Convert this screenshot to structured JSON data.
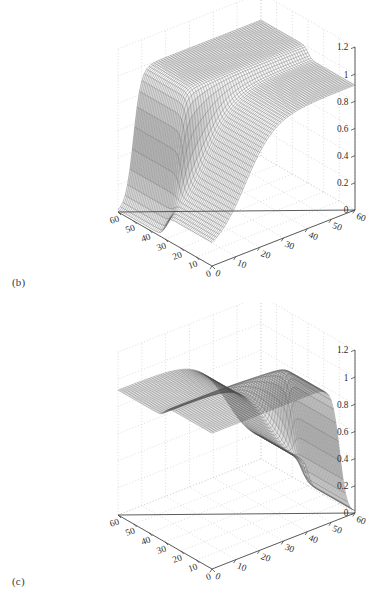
{
  "figure": {
    "background": "#ffffff",
    "ink": "#2b2b2b",
    "grid_color": "#c9c9c9",
    "axis_color": "#4a4a4a",
    "mesh_color": "#555555"
  },
  "panels": [
    {
      "id": "b",
      "label": "(b)",
      "zticks": [
        "1.2",
        "1",
        "0.8",
        "0.6",
        "0.4",
        "0.2",
        "0"
      ],
      "zvalues": [
        1.2,
        1,
        0.8,
        0.6,
        0.4,
        0.2,
        0
      ],
      "xticks_left": [
        "60",
        "50",
        "40",
        "30",
        "20",
        "10",
        "0"
      ],
      "xticks_right": [
        "0",
        "10",
        "20",
        "30",
        "40",
        "50",
        "60"
      ]
    },
    {
      "id": "c",
      "label": "(c)",
      "zticks": [
        "1.2",
        "1",
        "0.8",
        "0.6",
        "0.4",
        "0.2",
        "0"
      ],
      "zvalues": [
        1.2,
        1,
        0.8,
        0.6,
        0.4,
        0.2,
        0
      ],
      "xticks_left": [
        "60",
        "50",
        "40",
        "30",
        "20",
        "10",
        "0"
      ],
      "xticks_right": [
        "0",
        "10",
        "20",
        "30",
        "40",
        "50",
        "60"
      ]
    }
  ],
  "chart_data": [
    {
      "type": "surface",
      "panel": "b",
      "title": "",
      "xlabel": "",
      "ylabel": "",
      "zlabel": "",
      "xlim": [
        0,
        60
      ],
      "ylim": [
        0,
        60
      ],
      "zlim": [
        0,
        1.2
      ],
      "xticks": [
        0,
        10,
        20,
        30,
        40,
        50,
        60
      ],
      "yticks": [
        0,
        10,
        20,
        30,
        40,
        50,
        60
      ],
      "zticks": [
        0,
        0.2,
        0.4,
        0.6,
        0.8,
        1.0,
        1.2
      ],
      "grid": true,
      "legend": "none",
      "rendering": "wireframe-mesh",
      "description": "Step-like saturating surface: a low-valued plateau occupying roughly x<30 rising from about 0.1 to 0.9 along y, a sharp near-vertical cliff near x=30, and a high plateau near 1.0 for x>30 that falls steeply toward 0 at the front y edge.",
      "surface_samples": {
        "x": [
          0,
          10,
          20,
          30,
          40,
          50,
          60
        ],
        "y": [
          0,
          10,
          20,
          30,
          40,
          50,
          60
        ],
        "z": [
          [
            0.1,
            0.12,
            0.14,
            0.16,
            0.18,
            0.2,
            0.22
          ],
          [
            0.12,
            0.2,
            0.3,
            0.42,
            0.55,
            0.66,
            0.74
          ],
          [
            0.14,
            0.28,
            0.46,
            0.64,
            0.78,
            0.86,
            0.9
          ],
          [
            0.16,
            0.4,
            0.66,
            0.84,
            0.92,
            0.95,
            0.96
          ],
          [
            0.05,
            0.55,
            0.88,
            0.98,
            1.0,
            1.0,
            1.0
          ],
          [
            0.02,
            0.6,
            0.95,
            1.0,
            1.0,
            1.0,
            1.0
          ],
          [
            0.01,
            0.62,
            0.97,
            1.0,
            1.0,
            1.0,
            1.0
          ]
        ]
      }
    },
    {
      "type": "surface",
      "panel": "c",
      "title": "",
      "xlabel": "",
      "ylabel": "",
      "zlabel": "",
      "xlim": [
        0,
        60
      ],
      "ylim": [
        0,
        60
      ],
      "zlim": [
        0,
        1.2
      ],
      "xticks": [
        0,
        10,
        20,
        30,
        40,
        50,
        60
      ],
      "yticks": [
        0,
        10,
        20,
        30,
        40,
        50,
        60
      ],
      "zticks": [
        0,
        0.2,
        0.4,
        0.6,
        0.8,
        1.0,
        1.2
      ],
      "grid": true,
      "legend": "none",
      "rendering": "wireframe-mesh",
      "description": "Mirror image of panel (b): a high plateau near 1.0 on the left (large x) descending through a sharp cliff near the middle, with a lower shelf around 0.2 to 0.9 on the right side.",
      "surface_samples": {
        "x": [
          0,
          10,
          20,
          30,
          40,
          50,
          60
        ],
        "y": [
          0,
          10,
          20,
          30,
          40,
          50,
          60
        ],
        "z": [
          [
            1.0,
            1.0,
            1.0,
            1.0,
            0.97,
            0.62,
            0.01
          ],
          [
            1.0,
            1.0,
            1.0,
            1.0,
            0.95,
            0.6,
            0.02
          ],
          [
            1.0,
            1.0,
            1.0,
            0.98,
            0.88,
            0.55,
            0.05
          ],
          [
            0.96,
            0.95,
            0.92,
            0.84,
            0.66,
            0.4,
            0.16
          ],
          [
            0.9,
            0.86,
            0.78,
            0.64,
            0.46,
            0.28,
            0.14
          ],
          [
            0.74,
            0.66,
            0.55,
            0.42,
            0.3,
            0.2,
            0.12
          ],
          [
            0.22,
            0.2,
            0.18,
            0.16,
            0.14,
            0.12,
            0.1
          ]
        ]
      }
    }
  ]
}
